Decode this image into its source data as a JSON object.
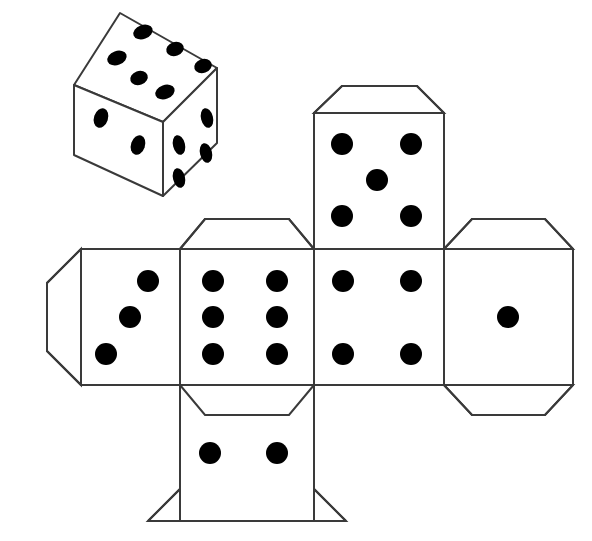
{
  "figure": {
    "background_color": "#ffffff",
    "stroke_color": "#3a3a3a",
    "pip_color": "#000000",
    "fill_color": "#ffffff",
    "stroke_width": 2,
    "width": 592,
    "height": 541
  },
  "die_3d": {
    "label": "Isometric die illustration",
    "faces": [
      {
        "name": "top-face",
        "value": 6,
        "pip_shape": "ellipse",
        "outline": "120,13 217,68 163,122 74,85",
        "pips": [
          {
            "cx": 143,
            "cy": 32,
            "rx": 10,
            "ry": 7,
            "rot": -20
          },
          {
            "cx": 175,
            "cy": 49,
            "rx": 9,
            "ry": 7,
            "rot": -20
          },
          {
            "cx": 203,
            "cy": 66,
            "rx": 9,
            "ry": 7,
            "rot": -20
          },
          {
            "cx": 117,
            "cy": 58,
            "rx": 10,
            "ry": 7,
            "rot": -20
          },
          {
            "cx": 139,
            "cy": 78,
            "rx": 9,
            "ry": 7,
            "rot": -20
          },
          {
            "cx": 165,
            "cy": 92,
            "rx": 10,
            "ry": 7,
            "rot": -20
          }
        ]
      },
      {
        "name": "left-face",
        "value": 2,
        "pip_shape": "ellipse",
        "outline": "74,85 163,122 163,196 74,155",
        "pips": [
          {
            "cx": 101,
            "cy": 118,
            "rx": 7,
            "ry": 10,
            "rot": 18
          },
          {
            "cx": 138,
            "cy": 145,
            "rx": 7,
            "ry": 10,
            "rot": 18
          }
        ]
      },
      {
        "name": "right-face",
        "value": 4,
        "pip_shape": "ellipse",
        "outline": "163,122 217,68 217,143 163,196",
        "pips": [
          {
            "cx": 179,
            "cy": 145,
            "rx": 6,
            "ry": 10,
            "rot": -14
          },
          {
            "cx": 207,
            "cy": 118,
            "rx": 6,
            "ry": 10,
            "rot": -14
          },
          {
            "cx": 179,
            "cy": 178,
            "rx": 6,
            "ry": 10,
            "rot": -14
          },
          {
            "cx": 206,
            "cy": 153,
            "rx": 6,
            "ry": 10,
            "rot": -14
          }
        ]
      }
    ]
  },
  "cube_net": {
    "label": "Unfolded cube net with six die faces and glue flaps",
    "pip_radius": 11,
    "panels": [
      {
        "name": "net-panel-three",
        "position": "row-middle-col-1",
        "value": 3,
        "rect": {
          "x": 81,
          "y": 249,
          "w": 99,
          "h": 136
        },
        "pips": [
          {
            "cx": 148,
            "cy": 281
          },
          {
            "cx": 130,
            "cy": 317
          },
          {
            "cx": 106,
            "cy": 354
          }
        ],
        "flaps": [
          {
            "name": "flap-left",
            "side": "left",
            "points": "81,249 47,283 47,351 81,385"
          }
        ]
      },
      {
        "name": "net-panel-six",
        "position": "row-middle-col-2",
        "value": 6,
        "rect": {
          "x": 180,
          "y": 249,
          "w": 134,
          "h": 136
        },
        "pips": [
          {
            "cx": 213,
            "cy": 281
          },
          {
            "cx": 213,
            "cy": 317
          },
          {
            "cx": 213,
            "cy": 354
          },
          {
            "cx": 277,
            "cy": 281
          },
          {
            "cx": 277,
            "cy": 317
          },
          {
            "cx": 277,
            "cy": 354
          }
        ],
        "flaps": [
          {
            "name": "flap-top",
            "side": "top",
            "points": "180,249 205,219 289,219 314,249"
          },
          {
            "name": "flap-bottom",
            "side": "bottom",
            "points": "180,385 205,415 289,415 314,385"
          }
        ]
      },
      {
        "name": "net-panel-four",
        "position": "row-middle-col-3",
        "value": 4,
        "rect": {
          "x": 314,
          "y": 249,
          "w": 130,
          "h": 136
        },
        "pips": [
          {
            "cx": 343,
            "cy": 281
          },
          {
            "cx": 343,
            "cy": 354
          },
          {
            "cx": 411,
            "cy": 281
          },
          {
            "cx": 411,
            "cy": 354
          }
        ],
        "flaps": []
      },
      {
        "name": "net-panel-one",
        "position": "row-middle-col-4",
        "value": 1,
        "rect": {
          "x": 444,
          "y": 249,
          "w": 129,
          "h": 136
        },
        "pips": [
          {
            "cx": 508,
            "cy": 317
          }
        ],
        "flaps": [
          {
            "name": "flap-top",
            "side": "top",
            "points": "444,249 472,219 545,219 573,249"
          },
          {
            "name": "flap-bottom",
            "side": "bottom",
            "points": "444,385 472,415 545,415 573,385"
          }
        ]
      },
      {
        "name": "net-panel-five",
        "position": "row-top",
        "value": 5,
        "rect": {
          "x": 314,
          "y": 113,
          "w": 130,
          "h": 136
        },
        "pips": [
          {
            "cx": 342,
            "cy": 144
          },
          {
            "cx": 342,
            "cy": 216
          },
          {
            "cx": 411,
            "cy": 144
          },
          {
            "cx": 411,
            "cy": 216
          },
          {
            "cx": 377,
            "cy": 180
          }
        ],
        "flaps": [
          {
            "name": "flap-top",
            "side": "top",
            "points": "314,113 342,86 417,86 444,113"
          }
        ]
      },
      {
        "name": "net-panel-two",
        "position": "row-bottom",
        "value": 2,
        "rect": {
          "x": 180,
          "y": 385,
          "w": 134,
          "h": 136
        },
        "pips": [
          {
            "cx": 210,
            "cy": 453
          },
          {
            "cx": 277,
            "cy": 453
          }
        ],
        "flaps": [
          {
            "name": "flap-bottom-left-chamfer",
            "side": "corner",
            "points": "180,521 180,489 148,521"
          },
          {
            "name": "flap-bottom-right-chamfer",
            "side": "corner",
            "points": "314,521 314,489 346,521"
          }
        ]
      }
    ]
  }
}
